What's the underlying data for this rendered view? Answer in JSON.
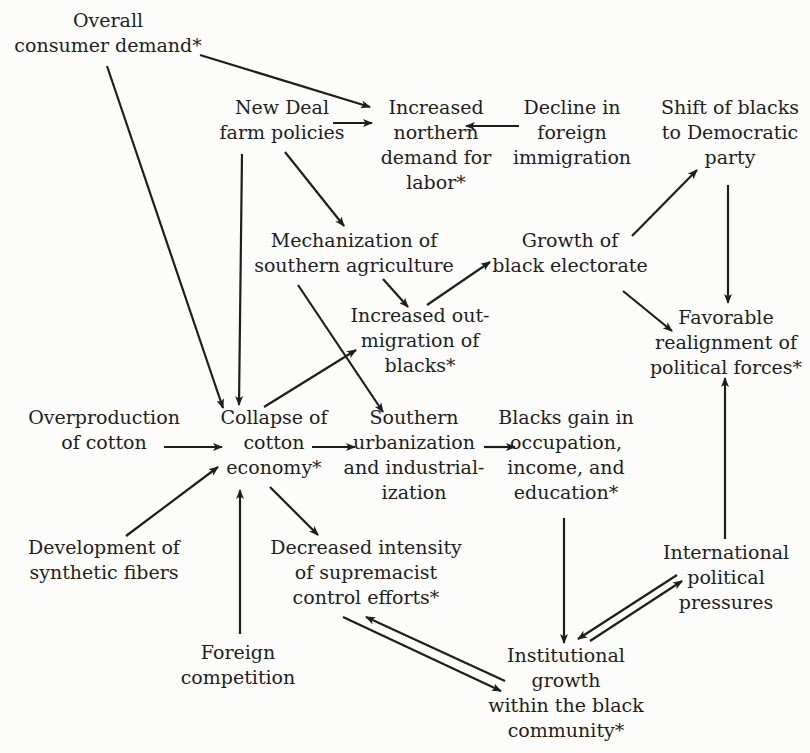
{
  "diagram": {
    "nodes": [
      {
        "id": "consumer_demand",
        "lines": [
          "Overall",
          "consumer demand*"
        ],
        "x": 108,
        "y": 8
      },
      {
        "id": "new_deal",
        "lines": [
          "New Deal",
          "farm policies"
        ],
        "x": 282,
        "y": 95
      },
      {
        "id": "northern_demand",
        "lines": [
          "Increased",
          "northern",
          "demand for",
          "labor*"
        ],
        "x": 436,
        "y": 95
      },
      {
        "id": "decline_immigration",
        "lines": [
          "Decline in",
          "foreign",
          "immigration"
        ],
        "x": 572,
        "y": 95
      },
      {
        "id": "shift_democratic",
        "lines": [
          "Shift of blacks",
          "to Democratic",
          "party"
        ],
        "x": 730,
        "y": 95
      },
      {
        "id": "mechanization",
        "lines": [
          "Mechanization of",
          "southern agriculture"
        ],
        "x": 354,
        "y": 228
      },
      {
        "id": "black_electorate",
        "lines": [
          "Growth of",
          "black electorate"
        ],
        "x": 570,
        "y": 228
      },
      {
        "id": "out_migration",
        "lines": [
          "Increased out-",
          "migration of",
          "blacks*"
        ],
        "x": 420,
        "y": 303
      },
      {
        "id": "favorable_realignment",
        "lines": [
          "Favorable",
          "realignment of",
          "political forces*"
        ],
        "x": 726,
        "y": 305
      },
      {
        "id": "overproduction",
        "lines": [
          "Overproduction",
          "of cotton"
        ],
        "x": 104,
        "y": 405
      },
      {
        "id": "collapse_cotton",
        "lines": [
          "Collapse of",
          "cotton",
          "economy*"
        ],
        "x": 274,
        "y": 405
      },
      {
        "id": "southern_urbanization",
        "lines": [
          "Southern",
          "urbanization",
          "and industrial-",
          "ization"
        ],
        "x": 414,
        "y": 405
      },
      {
        "id": "blacks_gain",
        "lines": [
          "Blacks gain in",
          "occupation,",
          "income, and",
          "education*"
        ],
        "x": 566,
        "y": 405
      },
      {
        "id": "synthetic_fibers",
        "lines": [
          "Development of",
          "synthetic fibers"
        ],
        "x": 104,
        "y": 535
      },
      {
        "id": "decreased_intensity",
        "lines": [
          "Decreased intensity",
          "of supremacist",
          "control efforts*"
        ],
        "x": 366,
        "y": 535
      },
      {
        "id": "international_pressures",
        "lines": [
          "International",
          "political",
          "pressures"
        ],
        "x": 726,
        "y": 540
      },
      {
        "id": "foreign_competition",
        "lines": [
          "Foreign",
          "competition"
        ],
        "x": 238,
        "y": 640
      },
      {
        "id": "institutional_growth",
        "lines": [
          "Institutional",
          "growth",
          "within the black",
          "community*"
        ],
        "x": 566,
        "y": 643
      }
    ],
    "edges": [
      {
        "from": "consumer_demand",
        "to": "northern_demand",
        "x1": 200,
        "y1": 55,
        "x2": 370,
        "y2": 107
      },
      {
        "from": "new_deal",
        "to": "northern_demand",
        "x1": 333,
        "y1": 123,
        "x2": 372,
        "y2": 123
      },
      {
        "from": "decline_immigration",
        "to": "northern_demand",
        "x1": 519,
        "y1": 126,
        "x2": 466,
        "y2": 126
      },
      {
        "from": "consumer_demand",
        "to": "collapse_cotton",
        "x1": 107,
        "y1": 66,
        "x2": 223,
        "y2": 408
      },
      {
        "from": "new_deal",
        "to": "collapse_cotton",
        "x1": 242,
        "y1": 154,
        "x2": 239,
        "y2": 405
      },
      {
        "from": "new_deal",
        "to": "mechanization",
        "x1": 285,
        "y1": 152,
        "x2": 344,
        "y2": 226
      },
      {
        "from": "mechanization",
        "to": "out_migration",
        "x1": 383,
        "y1": 279,
        "x2": 408,
        "y2": 307
      },
      {
        "from": "mechanization",
        "to": "southern_urbanization",
        "x1": 298,
        "y1": 285,
        "x2": 383,
        "y2": 412
      },
      {
        "from": "out_migration",
        "to": "black_electorate",
        "x1": 427,
        "y1": 305,
        "x2": 490,
        "y2": 262
      },
      {
        "from": "collapse_cotton",
        "to": "out_migration",
        "x1": 264,
        "y1": 407,
        "x2": 356,
        "y2": 350
      },
      {
        "from": "black_electorate",
        "to": "shift_democratic",
        "x1": 632,
        "y1": 236,
        "x2": 697,
        "y2": 170
      },
      {
        "from": "shift_democratic",
        "to": "favorable_realignment",
        "x1": 728,
        "y1": 185,
        "x2": 728,
        "y2": 303
      },
      {
        "from": "black_electorate",
        "to": "favorable_realignment",
        "x1": 623,
        "y1": 291,
        "x2": 672,
        "y2": 331
      },
      {
        "from": "overproduction",
        "to": "collapse_cotton",
        "x1": 164,
        "y1": 447,
        "x2": 222,
        "y2": 447
      },
      {
        "from": "collapse_cotton",
        "to": "southern_urbanization",
        "x1": 312,
        "y1": 447,
        "x2": 355,
        "y2": 447
      },
      {
        "from": "southern_urbanization",
        "to": "blacks_gain",
        "x1": 484,
        "y1": 447,
        "x2": 515,
        "y2": 447
      },
      {
        "from": "synthetic_fibers",
        "to": "collapse_cotton",
        "x1": 126,
        "y1": 536,
        "x2": 218,
        "y2": 467
      },
      {
        "from": "foreign_competition",
        "to": "collapse_cotton",
        "x1": 240,
        "y1": 634,
        "x2": 240,
        "y2": 490
      },
      {
        "from": "collapse_cotton",
        "to": "decreased_intensity",
        "x1": 270,
        "y1": 487,
        "x2": 318,
        "y2": 535
      },
      {
        "from": "blacks_gain",
        "to": "institutional_growth",
        "x1": 564,
        "y1": 518,
        "x2": 564,
        "y2": 643
      },
      {
        "from": "international_pressures",
        "to": "favorable_realignment",
        "x1": 725,
        "y1": 539,
        "x2": 725,
        "y2": 378
      },
      {
        "from": "international_pressures",
        "to": "institutional_growth",
        "x1": 677,
        "y1": 575,
        "x2": 578,
        "y2": 639
      },
      {
        "from": "institutional_growth",
        "to": "international_pressures",
        "x1": 590,
        "y1": 641,
        "x2": 682,
        "y2": 581
      },
      {
        "from": "decreased_intensity",
        "to": "institutional_growth",
        "x1": 343,
        "y1": 617,
        "x2": 501,
        "y2": 691
      },
      {
        "from": "institutional_growth",
        "to": "decreased_intensity",
        "x1": 505,
        "y1": 681,
        "x2": 366,
        "y2": 617
      }
    ]
  }
}
